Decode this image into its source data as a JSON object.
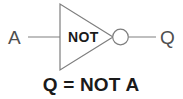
{
  "figure": {
    "width": 183,
    "height": 99,
    "background_color": "#ffffff",
    "diagram_type": "logic-gate-symbol"
  },
  "colors": {
    "background": "#ffffff",
    "wire_stroke": "#8a8a8a",
    "symbol_outline": "#7e7e7e",
    "thin_label_text": "#4f4f4f",
    "bold_label_text": "#1a1a1a",
    "bubble_fill": "#ffffff"
  },
  "gate": {
    "type": "NOT",
    "body_label": "NOT",
    "body_shape": "triangle",
    "has_inversion_bubble": true,
    "triangle_points": "60,4 60,70 113,37",
    "bubble": {
      "cx": 120.5,
      "cy": 37,
      "r": 7.8
    }
  },
  "ports": {
    "input": {
      "label": "A",
      "label_x": 8,
      "label_y": 44,
      "wire": {
        "x1": 28,
        "y1": 37,
        "x2": 60,
        "y2": 37
      }
    },
    "output": {
      "label": "Q",
      "label_x": 160,
      "label_y": 44,
      "wire": {
        "x1": 128.5,
        "y1": 37,
        "x2": 156,
        "y2": 37
      }
    }
  },
  "caption": {
    "text": "Q = NOT A",
    "x": 91,
    "y": 91
  }
}
